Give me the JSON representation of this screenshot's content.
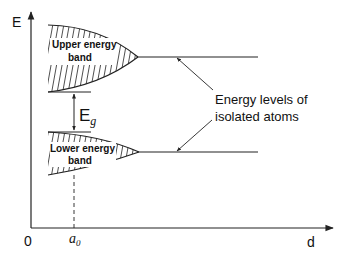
{
  "axes": {
    "y_label": "E",
    "x_label": "d",
    "origin_label": "0",
    "x_marker_label": "a",
    "x_marker_subscript": "0"
  },
  "bands": {
    "upper": {
      "line1": "Upper energy",
      "line2": "band"
    },
    "lower": {
      "line1": "Lower energy",
      "line2": "band"
    }
  },
  "gap": {
    "label": "E",
    "subscript": "g"
  },
  "annotation": {
    "line1": "Energy levels of",
    "line2": "isolated atoms"
  },
  "colors": {
    "stroke": "#222222",
    "background": "#ffffff"
  }
}
